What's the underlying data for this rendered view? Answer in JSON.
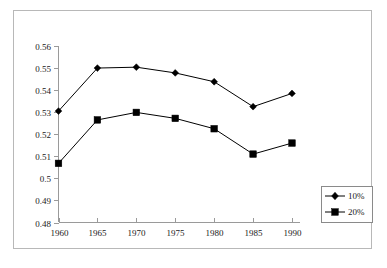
{
  "chart_data": {
    "type": "line",
    "title": "",
    "subtitle": "",
    "xlabel": "",
    "ylabel": "",
    "categories": [
      "1960",
      "1965",
      "1970",
      "1975",
      "1980",
      "1985",
      "1990"
    ],
    "x": [
      1960,
      1965,
      1970,
      1975,
      1980,
      1985,
      1990
    ],
    "series": [
      {
        "name": "10%",
        "marker": "diamond",
        "color": "#000000",
        "values": [
          0.5305,
          0.55,
          0.5504,
          0.5478,
          0.5438,
          0.5325,
          0.5385
        ]
      },
      {
        "name": "20%",
        "marker": "square",
        "color": "#000000",
        "values": [
          0.5068,
          0.5265,
          0.5299,
          0.5272,
          0.5225,
          0.511,
          0.516
        ]
      }
    ],
    "ylim": [
      0.48,
      0.56
    ],
    "xlim": [
      1960,
      1990
    ],
    "yticks": [
      0.48,
      0.49,
      0.5,
      0.51,
      0.52,
      0.53,
      0.54,
      0.55,
      0.56
    ],
    "ytick_labels": [
      "0.48",
      "0.49",
      "0.5",
      "0.51",
      "0.52",
      "0.53",
      "0.54",
      "0.55",
      "0.56"
    ],
    "xticks": [
      1960,
      1965,
      1970,
      1975,
      1980,
      1985,
      1990
    ],
    "xtick_labels": [
      "1960",
      "1965",
      "1970",
      "1975",
      "1980",
      "1985",
      "1990"
    ],
    "grid": false,
    "legend_position": "bottom-right",
    "legend_entries": [
      "10%",
      "20%"
    ],
    "axis_color": "#9a9a9a",
    "frame_color": "#b8b8b8",
    "background": "#ffffff"
  }
}
